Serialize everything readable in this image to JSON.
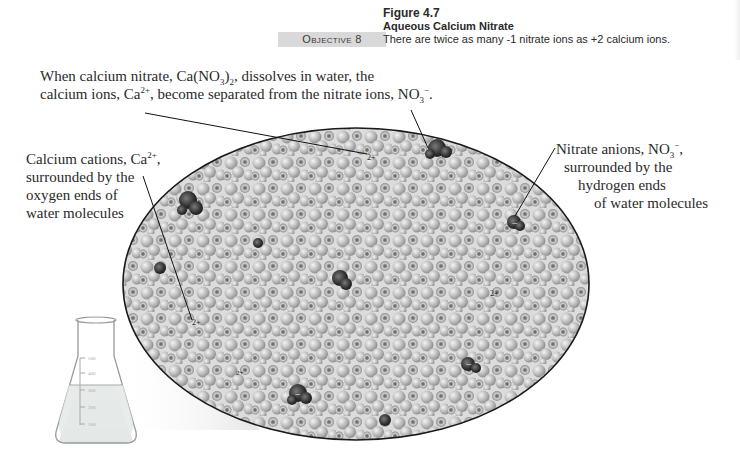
{
  "objective": {
    "label": "Objective 8"
  },
  "figure": {
    "number": "Figure 4.7",
    "title": "Aqueous Calcium Nitrate",
    "caption": "There are twice as many -1 nitrate ions as +2 calcium ions."
  },
  "labels": {
    "top": {
      "line1_pre": "When calcium nitrate, Ca(NO",
      "line1_sub1": "3",
      "line1_mid": ")",
      "line1_sub2": "2",
      "line1_post": ", dissolves in water, the",
      "line2_pre": "calcium ions, Ca",
      "line2_sup": "2+",
      "line2_mid": ", become separated from the nitrate ions, NO",
      "line2_sub": "3",
      "line2_sup2": "−",
      "line2_post": "."
    },
    "left": {
      "line1_pre": "Calcium cations, Ca",
      "line1_sup": "2+",
      "line1_post": ",",
      "line2": "surrounded by the",
      "line3": "oxygen ends of",
      "line4": "water molecules"
    },
    "right": {
      "line1_pre": "Nitrate anions, NO",
      "line1_sub": "3",
      "line1_sup": "−",
      "line1_post": ",",
      "line2": "surrounded by the",
      "line3": "hydrogen ends",
      "line4": "of water molecules"
    }
  },
  "ion_markers": {
    "calcium_charge": "2+",
    "nitrate_charge": "−"
  },
  "flask": {
    "graduations": [
      "500",
      "400",
      "300",
      "200",
      "100"
    ]
  },
  "colors": {
    "ellipse_fill": "#bdbdbd",
    "ellipse_stroke": "#1a1a1a",
    "ion_dark": "#3a3a3a",
    "objective_bg": "#d9d9d9",
    "text": "#2a2a2a"
  }
}
